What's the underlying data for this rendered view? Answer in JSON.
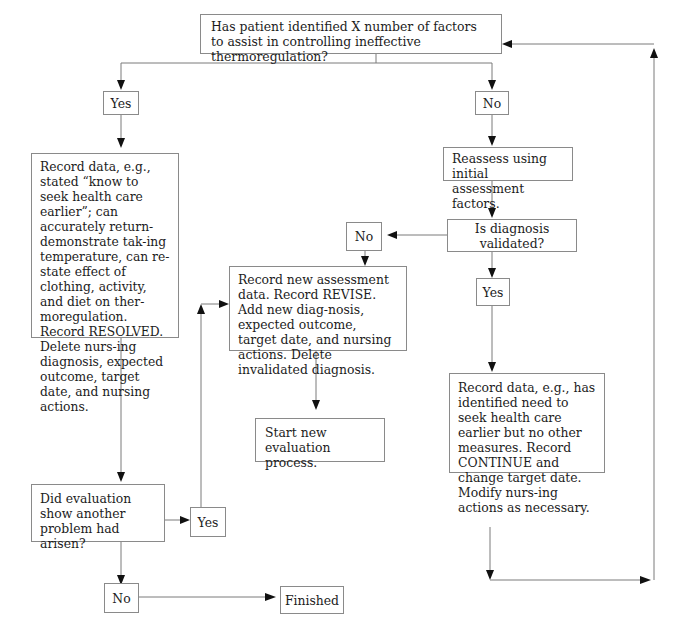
{
  "header": {
    "text": "CHAPTER 4 - NURSING DIAGNOSIS EXPECTED OUTCOME 2"
  },
  "flowchart": {
    "question_main": "Has patient identified X number of factors to assist in controlling ineffective thermoregulation?",
    "yes_1": "Yes",
    "no_1": "No",
    "record_resolved": "Record data, e.g., stated “know to seek health care earlier”; can accurately return-demonstrate tak-ing temperature, can re-state effect of clothing, activity, and diet on ther-moregulation. Record RESOLVED. Delete nurs-ing diagnosis, expected outcome, target date, and nursing actions.",
    "reassess": "Reassess using initial assessment factors.",
    "question_validated": "Is diagnosis validated?",
    "no_2": "No",
    "yes_2": "Yes",
    "record_revise": "Record new assessment data. Record REVISE. Add new diag-nosis, expected outcome, target date, and nursing actions. Delete invalidated diagnosis.",
    "start_new": "Start new evaluation process.",
    "record_continue": "Record data, e.g., has identified need to seek health care earlier but no other measures. Record CONTINUE and change target date. Modify nurs-ing actions as necessary.",
    "question_another": "Did evaluation show another problem had arisen?",
    "yes_3": "Yes",
    "no_3": "No",
    "finished": "Finished"
  },
  "colors": {
    "line": "#7a7a7a",
    "arrow": "#111111",
    "border": "#8a8a8a",
    "text": "#1c1c1c"
  }
}
